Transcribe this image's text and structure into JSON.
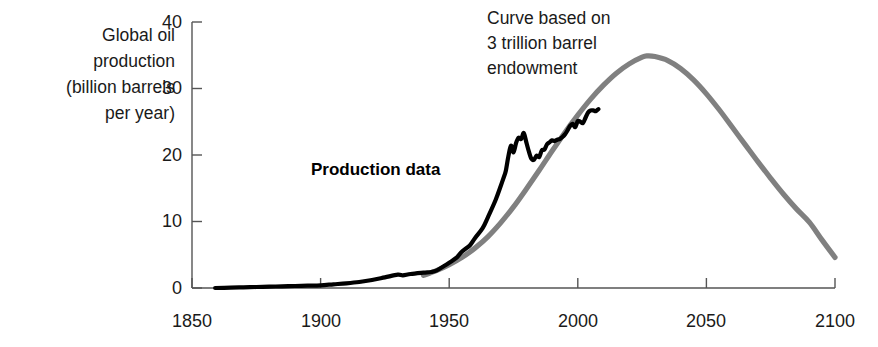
{
  "chart_data": {
    "type": "line",
    "title": "",
    "xlabel": "",
    "ylabel": "Global oil\nproduction\n(billion barrels\nper year)",
    "xlim": [
      1850,
      2100
    ],
    "ylim": [
      0,
      40
    ],
    "xticks": [
      1850,
      1900,
      1950,
      2000,
      2050,
      2100
    ],
    "xtick_labels": [
      "1850",
      "1900",
      "1950",
      "2000",
      "2050",
      "2100"
    ],
    "yticks": [
      0,
      10,
      20,
      30,
      40
    ],
    "ytick_labels": [
      "0",
      "10",
      "20",
      "30",
      "40"
    ],
    "grid": false,
    "legend_position": "inline-annotations",
    "annotations": [
      {
        "name": "hubbert-curve-note",
        "text": "Curve based on\n3 trillion barrel\nendowment",
        "x": 1965,
        "y": 39
      }
    ],
    "series": [
      {
        "name": "Production data",
        "color": "#000000",
        "style": "solid",
        "width": 4.2,
        "label_x": 1897,
        "label_y": 17.5,
        "points": [
          [
            1859,
            0.0
          ],
          [
            1865,
            0.05
          ],
          [
            1870,
            0.1
          ],
          [
            1875,
            0.15
          ],
          [
            1880,
            0.2
          ],
          [
            1885,
            0.25
          ],
          [
            1890,
            0.3
          ],
          [
            1895,
            0.35
          ],
          [
            1900,
            0.4
          ],
          [
            1905,
            0.55
          ],
          [
            1910,
            0.7
          ],
          [
            1915,
            0.9
          ],
          [
            1920,
            1.2
          ],
          [
            1925,
            1.6
          ],
          [
            1930,
            2.0
          ],
          [
            1932,
            1.9
          ],
          [
            1935,
            2.1
          ],
          [
            1940,
            2.3
          ],
          [
            1943,
            2.4
          ],
          [
            1945,
            2.6
          ],
          [
            1948,
            3.3
          ],
          [
            1950,
            3.8
          ],
          [
            1953,
            4.6
          ],
          [
            1955,
            5.5
          ],
          [
            1958,
            6.4
          ],
          [
            1960,
            7.5
          ],
          [
            1963,
            9.0
          ],
          [
            1965,
            10.6
          ],
          [
            1968,
            13.2
          ],
          [
            1970,
            15.3
          ],
          [
            1971,
            16.4
          ],
          [
            1972,
            17.6
          ],
          [
            1973,
            19.8
          ],
          [
            1974,
            21.4
          ],
          [
            1975,
            20.4
          ],
          [
            1976,
            21.8
          ],
          [
            1977,
            22.6
          ],
          [
            1978,
            22.4
          ],
          [
            1979,
            23.3
          ],
          [
            1980,
            21.9
          ],
          [
            1981,
            20.5
          ],
          [
            1982,
            19.4
          ],
          [
            1983,
            19.3
          ],
          [
            1984,
            19.9
          ],
          [
            1985,
            19.7
          ],
          [
            1986,
            20.7
          ],
          [
            1987,
            20.8
          ],
          [
            1988,
            21.6
          ],
          [
            1989,
            21.9
          ],
          [
            1990,
            22.2
          ],
          [
            1991,
            22.1
          ],
          [
            1992,
            22.3
          ],
          [
            1993,
            22.4
          ],
          [
            1994,
            22.7
          ],
          [
            1995,
            23.1
          ],
          [
            1996,
            23.7
          ],
          [
            1997,
            24.4
          ],
          [
            1998,
            24.7
          ],
          [
            1999,
            24.2
          ],
          [
            2000,
            25.1
          ],
          [
            2001,
            25.0
          ],
          [
            2002,
            24.8
          ],
          [
            2003,
            25.6
          ],
          [
            2004,
            26.4
          ],
          [
            2005,
            26.7
          ],
          [
            2006,
            26.7
          ],
          [
            2007,
            26.6
          ],
          [
            2008,
            26.9
          ]
        ]
      },
      {
        "name": "Curve based on 3 trillion barrel endowment",
        "color": "#808080",
        "style": "solid",
        "width": 5.2,
        "points": [
          [
            1940,
            1.9
          ],
          [
            1945,
            2.6
          ],
          [
            1950,
            3.5
          ],
          [
            1955,
            4.6
          ],
          [
            1960,
            6.0
          ],
          [
            1965,
            7.7
          ],
          [
            1970,
            9.8
          ],
          [
            1975,
            12.2
          ],
          [
            1980,
            14.9
          ],
          [
            1985,
            17.7
          ],
          [
            1990,
            20.6
          ],
          [
            1995,
            23.4
          ],
          [
            2000,
            26.0
          ],
          [
            2005,
            28.4
          ],
          [
            2010,
            30.5
          ],
          [
            2015,
            32.3
          ],
          [
            2020,
            33.7
          ],
          [
            2025,
            34.7
          ],
          [
            2027,
            34.9
          ],
          [
            2030,
            34.8
          ],
          [
            2035,
            34.2
          ],
          [
            2040,
            33.0
          ],
          [
            2045,
            31.3
          ],
          [
            2050,
            29.2
          ],
          [
            2055,
            26.8
          ],
          [
            2060,
            24.2
          ],
          [
            2065,
            21.6
          ],
          [
            2070,
            19.0
          ],
          [
            2075,
            16.5
          ],
          [
            2080,
            14.1
          ],
          [
            2085,
            11.9
          ],
          [
            2090,
            9.9
          ],
          [
            2095,
            7.2
          ],
          [
            2100,
            4.6
          ]
        ]
      }
    ]
  },
  "axes": {
    "axis_color": "#555555",
    "tick_color": "#555555"
  }
}
